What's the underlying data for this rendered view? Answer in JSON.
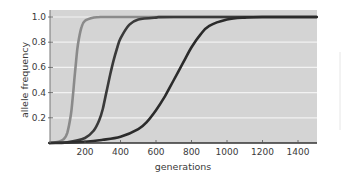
{
  "chart_data": {
    "type": "line",
    "title": "",
    "xlabel": "generations",
    "ylabel": "allele frequency",
    "xlim": [
      0,
      1505
    ],
    "ylim": [
      0,
      1.05
    ],
    "x_ticks": [
      200,
      400,
      600,
      800,
      1000,
      1200,
      1400
    ],
    "x_tick_labels": [
      "200",
      "400",
      "600",
      "800",
      "1000",
      "1200",
      "1400"
    ],
    "y_ticks": [
      0.2,
      0.4,
      0.6,
      0.8,
      1.0
    ],
    "y_tick_labels": [
      "0.2",
      "0.4",
      "0.6",
      "0.8",
      "1.0"
    ],
    "grid": "horizontal",
    "legend": "none",
    "colors": {
      "plot_background": "#d4d4d4",
      "gridline": "#f2f2f2",
      "axis": "#555555"
    },
    "series": [
      {
        "name": "curve-1",
        "color": "#8a8a8a",
        "x": [
          0,
          50,
          80,
          100,
          120,
          130,
          140,
          150,
          160,
          180,
          200,
          250,
          300,
          400,
          1505
        ],
        "y": [
          0.0,
          0.01,
          0.03,
          0.08,
          0.22,
          0.35,
          0.5,
          0.65,
          0.78,
          0.92,
          0.97,
          0.995,
          1.0,
          1.0,
          1.0
        ]
      },
      {
        "name": "curve-2",
        "color": "#3a3a3a",
        "x": [
          0,
          100,
          200,
          250,
          280,
          300,
          320,
          340,
          360,
          380,
          400,
          450,
          500,
          600,
          700,
          1505
        ],
        "y": [
          0.0,
          0.005,
          0.04,
          0.1,
          0.18,
          0.27,
          0.4,
          0.53,
          0.65,
          0.75,
          0.83,
          0.94,
          0.98,
          0.995,
          1.0,
          1.0
        ]
      },
      {
        "name": "curve-3",
        "color": "#2b2b2b",
        "x": [
          0,
          200,
          300,
          400,
          500,
          550,
          600,
          650,
          700,
          750,
          800,
          850,
          900,
          1000,
          1100,
          1200,
          1505
        ],
        "y": [
          0.0,
          0.01,
          0.025,
          0.05,
          0.11,
          0.17,
          0.26,
          0.37,
          0.5,
          0.63,
          0.76,
          0.86,
          0.93,
          0.98,
          0.995,
          1.0,
          1.0
        ]
      }
    ]
  }
}
